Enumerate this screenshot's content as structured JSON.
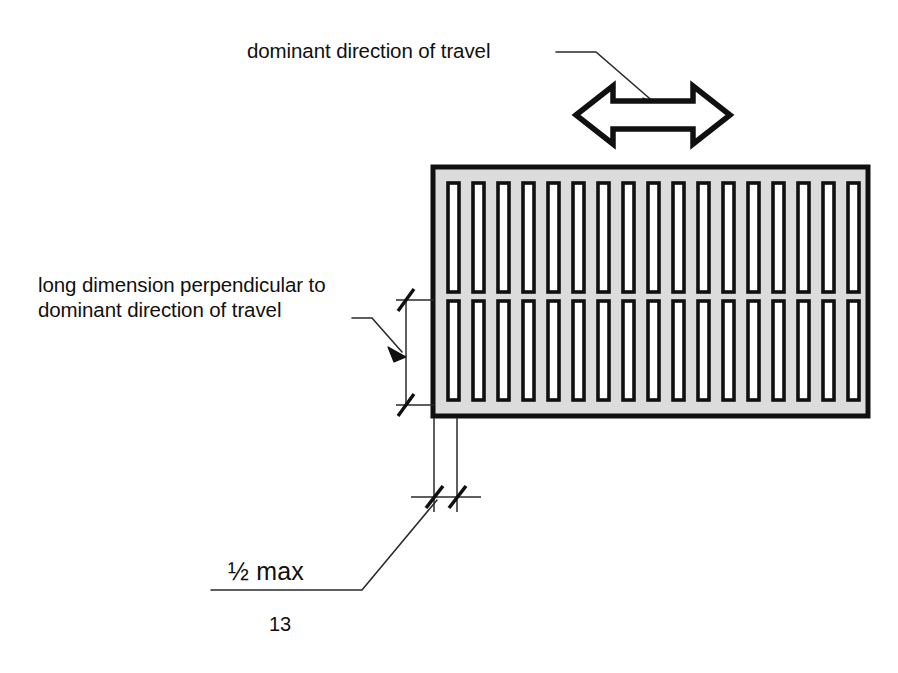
{
  "figure": {
    "number": "13",
    "background_color": "#ffffff",
    "line_color": "#101010"
  },
  "labels": {
    "dominant_direction": "dominant direction of travel",
    "long_dimension_line1": "long dimension perpendicular to",
    "long_dimension_line2": "dominant direction of travel",
    "half_max_fraction": "½",
    "half_max_word": " max",
    "half_max_full": "½ max"
  },
  "grate": {
    "name": "drainage-grate",
    "fill_color": "#dcdcdc",
    "border_color": "#101010",
    "slot_fill_color": "#ffffff",
    "slot_rows": 2,
    "slots_per_row": 17,
    "x": 433,
    "y": 167,
    "width": 435,
    "height": 249
  },
  "arrow": {
    "name": "double-headed-arrow",
    "orientation": "horizontal-bidirectional",
    "meaning": "dominant direction of travel",
    "outline_color": "#101010",
    "fill_color": "#ffffff"
  },
  "dimensions": [
    {
      "name": "slot-length-dimension",
      "orientation": "vertical",
      "tick_style": "architectural-slash",
      "label": "long dimension perpendicular to dominant direction of travel"
    },
    {
      "name": "slot-width-dimension",
      "orientation": "horizontal",
      "tick_style": "architectural-slash",
      "label": "½ max"
    }
  ]
}
